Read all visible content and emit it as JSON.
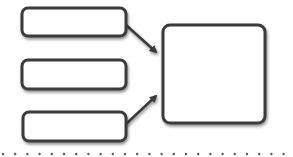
{
  "diagram": {
    "type": "many-to-one flow",
    "colors": {
      "stroke": "#3a3a3a",
      "fill": "#ffffff",
      "dots": "#5a5a5a",
      "background": "#ffffff"
    },
    "input_boxes": [
      {
        "id": "input-1",
        "label": ""
      },
      {
        "id": "input-2",
        "label": ""
      },
      {
        "id": "input-3",
        "label": ""
      }
    ],
    "output_box": {
      "id": "output",
      "label": ""
    },
    "arrows": [
      {
        "from": "input-1",
        "to": "output"
      },
      {
        "from": "input-2",
        "to": "output"
      },
      {
        "from": "input-3",
        "to": "output"
      }
    ],
    "separator": {
      "style": "dotted"
    }
  }
}
